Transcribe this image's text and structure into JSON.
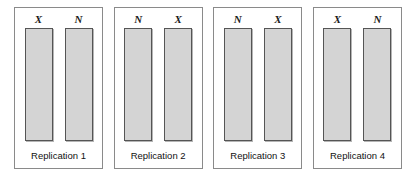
{
  "figure": {
    "type": "randomized-block-diagram",
    "background_color": "#ffffff",
    "panel_border_color": "#8a8a8a",
    "bar_fill_color": "#d4d4d4",
    "bar_border_color": "#555555",
    "panels": [
      {
        "caption": "Replication 1",
        "units": [
          {
            "label": "X"
          },
          {
            "label": "N"
          }
        ]
      },
      {
        "caption": "Replication 2",
        "units": [
          {
            "label": "N"
          },
          {
            "label": "X"
          }
        ]
      },
      {
        "caption": "Replication 3",
        "units": [
          {
            "label": "N"
          },
          {
            "label": "X"
          }
        ]
      },
      {
        "caption": "Replication 4",
        "units": [
          {
            "label": "X"
          },
          {
            "label": "N"
          }
        ]
      }
    ]
  }
}
